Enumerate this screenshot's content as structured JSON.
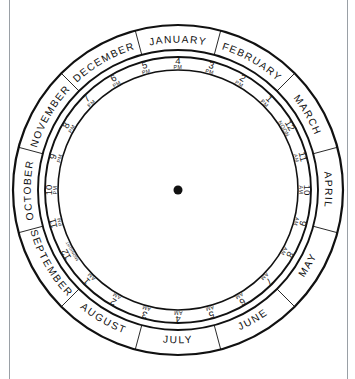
{
  "page": {
    "background_color": "#ffffff",
    "ink_color": "#111111",
    "margin_rule_color": "#9aa0a6"
  },
  "dial": {
    "center": {
      "x": 178,
      "y": 190
    },
    "radii": {
      "outer": 165,
      "month_inner": 140,
      "hour_outer": 133,
      "hour_inner": 120
    },
    "hub_radius": 4.5,
    "month_start_angle_deg": -15,
    "month_direction": "clockwise",
    "hour_direction": "counterclockwise"
  },
  "months": [
    {
      "label": "JANUARY",
      "index": 1,
      "center_angle_deg": 0
    },
    {
      "label": "FEBRUARY",
      "index": 2,
      "center_angle_deg": 30
    },
    {
      "label": "MARCH",
      "index": 3,
      "center_angle_deg": 60
    },
    {
      "label": "APRIL",
      "index": 4,
      "center_angle_deg": 90
    },
    {
      "label": "MAY",
      "index": 5,
      "center_angle_deg": 120
    },
    {
      "label": "JUNE",
      "index": 6,
      "center_angle_deg": 150
    },
    {
      "label": "JULY",
      "index": 7,
      "center_angle_deg": 180
    },
    {
      "label": "AUGUST",
      "index": 8,
      "center_angle_deg": 210
    },
    {
      "label": "SEPTEMBER",
      "index": 9,
      "center_angle_deg": 240
    },
    {
      "label": "OCTOBER",
      "index": 10,
      "center_angle_deg": 270
    },
    {
      "label": "NOVEMBER",
      "index": 11,
      "center_angle_deg": 300
    },
    {
      "label": "DECEMBER",
      "index": 12,
      "center_angle_deg": 330
    }
  ],
  "hours": [
    {
      "num": "4",
      "suffix": "PM",
      "angle_deg": 0
    },
    {
      "num": "3",
      "suffix": "PM",
      "angle_deg": 15
    },
    {
      "num": "2",
      "suffix": "PM",
      "angle_deg": 30
    },
    {
      "num": "1",
      "suffix": "PM",
      "angle_deg": 45
    },
    {
      "num": "12",
      "suffix": "NOON",
      "angle_deg": 60
    },
    {
      "num": "11",
      "suffix": "AM",
      "angle_deg": 75
    },
    {
      "num": "10",
      "suffix": "AM",
      "angle_deg": 90
    },
    {
      "num": "9",
      "suffix": "AM",
      "angle_deg": 105
    },
    {
      "num": "8",
      "suffix": "AM",
      "angle_deg": 120
    },
    {
      "num": "7",
      "suffix": "AM",
      "angle_deg": 135
    },
    {
      "num": "6",
      "suffix": "AM",
      "angle_deg": 150
    },
    {
      "num": "5",
      "suffix": "AM",
      "angle_deg": 165
    },
    {
      "num": "4",
      "suffix": "AM",
      "angle_deg": 180
    },
    {
      "num": "3",
      "suffix": "AM",
      "angle_deg": 195
    },
    {
      "num": "2",
      "suffix": "AM",
      "angle_deg": 210
    },
    {
      "num": "1",
      "suffix": "AM",
      "angle_deg": 225
    },
    {
      "num": "12",
      "suffix": "MIDNIGHT",
      "angle_deg": 240
    },
    {
      "num": "11",
      "suffix": "PM",
      "angle_deg": 255
    },
    {
      "num": "10",
      "suffix": "PM",
      "angle_deg": 270
    },
    {
      "num": "9",
      "suffix": "PM",
      "angle_deg": 285
    },
    {
      "num": "8",
      "suffix": "PM",
      "angle_deg": 300
    },
    {
      "num": "7",
      "suffix": "PM",
      "angle_deg": 315
    },
    {
      "num": "6",
      "suffix": "PM",
      "angle_deg": 330
    },
    {
      "num": "5",
      "suffix": "PM",
      "angle_deg": 345
    }
  ]
}
